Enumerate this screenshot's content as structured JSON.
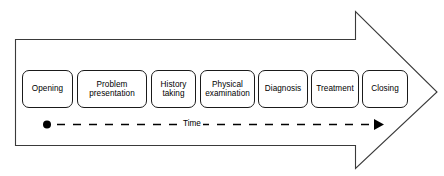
{
  "diagram": {
    "shape": "right-arrow",
    "stroke_color": "#1a1a1a",
    "fill_color": "#ffffff",
    "phases": [
      {
        "label": "Opening",
        "order": 1
      },
      {
        "label": "Problem\npresentation",
        "order": 2
      },
      {
        "label": "History\ntaking",
        "order": 3
      },
      {
        "label": "Physical\nexamination",
        "order": 4
      },
      {
        "label": "Diagnosis",
        "order": 5
      },
      {
        "label": "Treatment",
        "order": 6
      },
      {
        "label": "Closing",
        "order": 7
      }
    ],
    "timeline": {
      "label": "Time",
      "start_marker": "filled-dot",
      "end_marker": "arrowhead",
      "line_style": "dashed",
      "direction": "left-to-right"
    }
  }
}
